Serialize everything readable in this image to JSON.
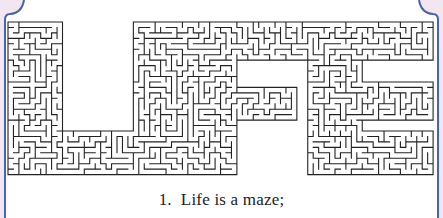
{
  "puzzle": {
    "word": "LIFE",
    "letters": [
      "L",
      "I",
      "F",
      "E"
    ],
    "type": "maze"
  },
  "caption": {
    "number": "1.",
    "text": "Life is a maze;"
  },
  "colors": {
    "frame_border": "#4a64a8",
    "corner_fill": "#f1e6f2",
    "maze_wall": "#222222",
    "background": "#ffffff"
  }
}
